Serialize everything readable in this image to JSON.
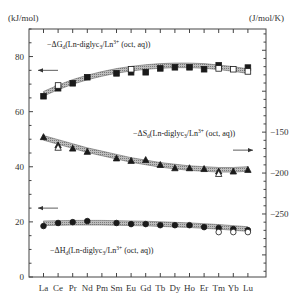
{
  "chart_data": {
    "type": "scatter",
    "title": "",
    "xlabel": "",
    "categories": [
      "La",
      "Ce",
      "Pr",
      "Nd",
      "Pm",
      "Sm",
      "Eu",
      "Gd",
      "Tb",
      "Dy",
      "Ho",
      "Er",
      "Tm",
      "Yb",
      "Lu"
    ],
    "left_axis": {
      "unit": "(kJ/mol)",
      "ylim": [
        0,
        90
      ],
      "ticks": [
        0,
        20,
        40,
        60,
        80
      ],
      "tick_labels": [
        "0",
        "20",
        "40",
        "60",
        "80"
      ]
    },
    "right_axis": {
      "unit": "(J/mol/K)",
      "ylim": [
        -327,
        -24
      ],
      "ticks": [
        -150,
        -200,
        -250
      ],
      "tick_labels": [
        "−150",
        "−200",
        "−250"
      ]
    },
    "grid": false,
    "series": [
      {
        "name": "-ΔG_d(Ln-diglyc3/Ln3+ (oct, aq))",
        "axis": "left",
        "marker": "square-filled",
        "values": [
          65.6,
          68.5,
          70.3,
          72.5,
          null,
          73.9,
          74.3,
          74.3,
          75.7,
          76.1,
          76.1,
          75.4,
          76.8,
          null,
          76.0
        ]
      },
      {
        "name": "-ΔG_d (reference, open)",
        "axis": "left",
        "marker": "square-open",
        "values": [
          null,
          69.5,
          null,
          null,
          null,
          null,
          75.4,
          null,
          null,
          null,
          null,
          null,
          75.7,
          75.4,
          74.6
        ]
      },
      {
        "name": "-ΔG_d fit",
        "axis": "left",
        "marker": "band",
        "values": [
          66.5,
          68.8,
          70.8,
          72.4,
          73.7,
          74.8,
          75.6,
          76.2,
          76.6,
          76.8,
          76.8,
          76.6,
          76.1,
          75.5,
          74.7
        ]
      },
      {
        "name": "-ΔS_d(Ln-diglyc3/Ln3+ (oct, aq))",
        "axis": "right",
        "marker": "triangle-filled",
        "values": [
          -156,
          -166,
          -170,
          -174,
          null,
          -182,
          -185,
          -184,
          -190,
          -194,
          -194,
          -195,
          -198,
          -198,
          -196
        ]
      },
      {
        "name": "-ΔS_d (reference, open)",
        "axis": "right",
        "marker": "triangle-open",
        "values": [
          null,
          -169,
          null,
          null,
          null,
          null,
          null,
          null,
          null,
          null,
          null,
          null,
          -201,
          null,
          null
        ]
      },
      {
        "name": "-ΔS_d fit",
        "axis": "right",
        "marker": "band",
        "values": [
          -157,
          -162,
          -167,
          -172,
          -176,
          -180,
          -184,
          -187,
          -190,
          -192,
          -194,
          -195,
          -196,
          -196,
          -195
        ]
      },
      {
        "name": "-ΔH_d(Ln-diglyc3/Ln3+ (oct, aq))",
        "axis": "left",
        "marker": "circle-filled",
        "values": [
          18.5,
          19.6,
          19.9,
          20.3,
          null,
          19.6,
          19.2,
          19.2,
          18.8,
          18.8,
          18.8,
          18.1,
          17.8,
          17.4,
          17.0
        ]
      },
      {
        "name": "-ΔH_d (reference, open)",
        "axis": "left",
        "marker": "circle-open",
        "values": [
          null,
          null,
          null,
          null,
          null,
          null,
          null,
          null,
          null,
          null,
          null,
          null,
          16.3,
          16.3,
          16.3
        ]
      },
      {
        "name": "-ΔH_d fit",
        "axis": "left",
        "marker": "band",
        "values": [
          19.5,
          19.6,
          19.7,
          19.7,
          19.7,
          19.6,
          19.5,
          19.4,
          19.2,
          19.0,
          18.8,
          18.5,
          18.2,
          17.8,
          17.4
        ]
      }
    ],
    "annotations": [
      {
        "text": "←",
        "meaning": "ΔG uses left axis",
        "near": "left",
        "value": 75
      },
      {
        "text": "→",
        "meaning": "ΔS uses right axis",
        "near": "right",
        "value": -172
      },
      {
        "text": "←",
        "meaning": "ΔH uses left axis",
        "near": "left",
        "value": 25
      }
    ],
    "labels": {
      "dG": {
        "prefix": "−ΔG",
        "sub": "d",
        "body": "(Ln-diglyc",
        "sub2": "3",
        "mid": "/Ln",
        "sup": "3+",
        "tail": " (oct, aq))"
      },
      "dS": {
        "prefix": "−ΔS",
        "sub": "d",
        "body": "(Ln-diglyc",
        "sub2": "3",
        "mid": "/Ln",
        "sup": "3+",
        "tail": " (oct, aq))"
      },
      "dH": {
        "prefix": "−ΔH",
        "sub": "d",
        "body": "(Ln-diglyc",
        "sub2": "3",
        "mid": "/Ln",
        "sup": "3+",
        "tail": " (oct, aq))"
      }
    }
  }
}
